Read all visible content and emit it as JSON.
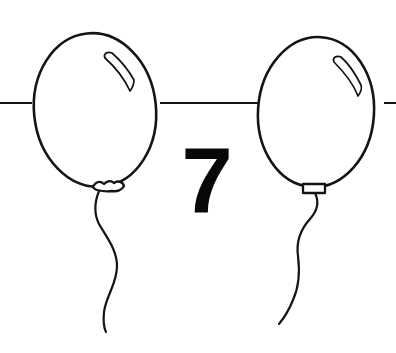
{
  "scene": {
    "title": "Two balloons with number seven",
    "style": "black line art on white",
    "background_color": "#ffffff",
    "ink_color": "#141414",
    "width": 396,
    "height": 353
  },
  "number": {
    "value": "7",
    "x": 207,
    "y": 212,
    "color": "#080808"
  },
  "balloons": [
    {
      "id": "left-balloon",
      "label": "Left balloon",
      "center_x": 95,
      "center_y": 110,
      "radius_x": 61,
      "radius_y": 77,
      "rotation_deg": -6,
      "fill": "#ffffff",
      "outline": "#141414",
      "highlight_path": "M 112 53 C 107 51 103 54 105 58 C 114 66 124 78 130 91 C 133 87 134 83 134 80 C 128 69 120 60 112 53 Z",
      "knot_path": "M 94 185 C 97 181 101 181 104 184 C 107 181 111 180 114 183 C 118 180 123 182 124 186 C 122 190 117 192 112 191 C 107 192 101 191 97 190 C 94 189 92 187 94 185 Z",
      "string_path": "M 99 191 C 95 201 93 212 99 224 C 107 238 117 250 117 266 C 117 284 106 296 104 312 C 103 322 104 328 106 332"
    },
    {
      "id": "right-balloon",
      "label": "Right balloon",
      "center_x": 316,
      "center_y": 112,
      "radius_x": 58,
      "radius_y": 75,
      "rotation_deg": 4,
      "fill": "#ffffff",
      "outline": "#141414",
      "highlight_path": "M 341 57 C 336 55 332 58 334 62 C 344 72 353 83 358 96 C 361 92 362 88 361 85 C 355 73 349 64 341 57 Z",
      "knot_path": "M 303 184 L 325 184 L 325 193 L 303 193 Z",
      "string_path": "M 315 193 C 319 201 318 210 310 219 C 300 230 296 242 298 256 C 300 272 299 287 293 300 C 289 310 284 318 279 324"
    }
  ],
  "horizontal_line": {
    "label": "String line across background",
    "y": 103,
    "segments": [
      {
        "x1": 0,
        "x2": 32
      },
      {
        "x1": 160,
        "x2": 266
      },
      {
        "x1": 384,
        "x2": 396
      }
    ],
    "color": "#141414"
  }
}
